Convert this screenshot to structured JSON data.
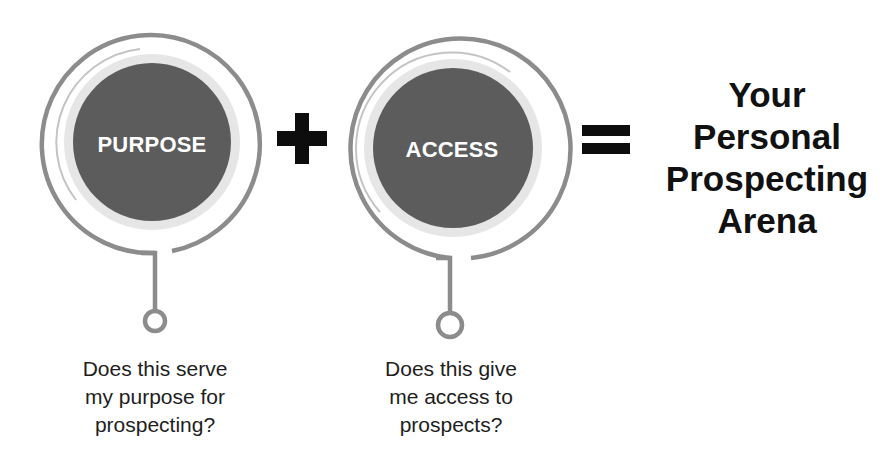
{
  "diagram": {
    "nodes": [
      {
        "id": "purpose",
        "label": "PURPOSE",
        "question_lines": [
          "Does this serve",
          "my purpose for",
          "prospecting?"
        ]
      },
      {
        "id": "access",
        "label": "ACCESS",
        "question_lines": [
          "Does this give",
          "me access to",
          "prospects?"
        ]
      }
    ],
    "operators": {
      "plus": "+",
      "equals": "="
    },
    "result": {
      "lines": [
        "Your",
        "Personal",
        "Prospecting",
        "Arena"
      ]
    },
    "colors": {
      "disk": "#5c5c5c",
      "ring": "#8c8c8c",
      "halo": "#e4e4e4",
      "inner_arc": "#c8c8c8",
      "operator": "#0d0d0d",
      "label_text": "#ffffff"
    }
  }
}
